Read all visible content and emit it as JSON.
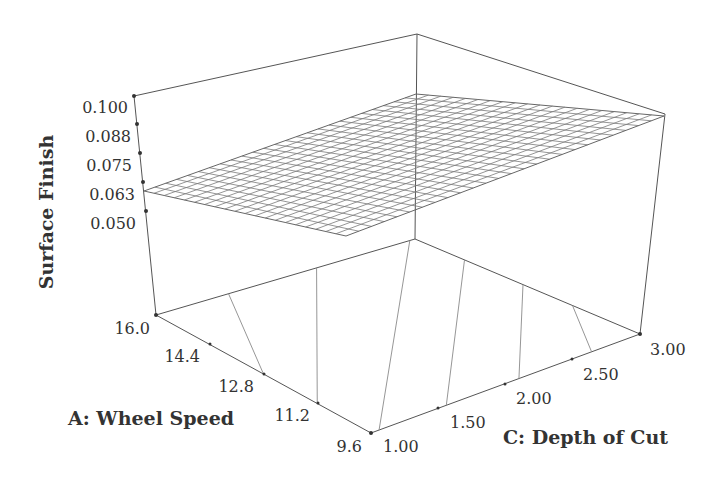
{
  "chart_data": {
    "type": "surface3d",
    "title": "",
    "zlabel": "Surface Finish",
    "xlabel": "A: Wheel Speed",
    "ylabel": "C: Depth of Cut",
    "z_ticks": [
      "0.100",
      "0.088",
      "0.075",
      "0.063",
      "0.050"
    ],
    "x_ticks": [
      "16.0",
      "14.4",
      "12.8",
      "11.2",
      "9.6"
    ],
    "y_ticks": [
      "1.00",
      "1.50",
      "2.00",
      "2.50",
      "3.00"
    ],
    "x_range": [
      9.6,
      16.0
    ],
    "y_range": [
      1.0,
      3.0
    ],
    "z_range": [
      0.05,
      0.1
    ],
    "surface_corners": [
      {
        "A": 16.0,
        "C": 1.0,
        "z": 0.059
      },
      {
        "A": 16.0,
        "C": 3.0,
        "z": 0.072
      },
      {
        "A": 9.6,
        "C": 3.0,
        "z": 0.099
      },
      {
        "A": 9.6,
        "C": 1.0,
        "z": 0.066
      }
    ],
    "grid": {
      "rows": 20,
      "cols": 25
    },
    "floor_contours": 7,
    "surface_style": "wireframe mesh (grey)"
  },
  "labels": {
    "z_title": "Surface Finish",
    "x_title": "A: Wheel Speed",
    "y_title": "C: Depth of Cut",
    "z_ticks": [
      "0.100",
      "0.088",
      "0.075",
      "0.063",
      "0.050"
    ],
    "x_ticks": [
      "16.0",
      "14.4",
      "12.8",
      "11.2",
      "9.6"
    ],
    "y_ticks": [
      "1.00",
      "1.50",
      "2.00",
      "2.50",
      "3.00"
    ]
  },
  "colors": {
    "axis": "#555555",
    "mesh": "#7a7a7a",
    "text": "#333333",
    "background": "#ffffff"
  }
}
